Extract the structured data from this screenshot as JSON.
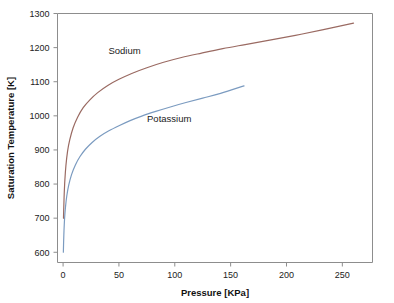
{
  "chart_data": {
    "type": "line",
    "title": "",
    "xlabel": "Pressure [KPa]",
    "ylabel": "Saturation Temperature [K]",
    "xlim": [
      -5,
      277
    ],
    "ylim": [
      570,
      1300
    ],
    "grid": false,
    "legend_position": "inline-annotations",
    "xticks": [
      0,
      50,
      100,
      150,
      200,
      250
    ],
    "xtick_labels": [
      "0",
      "50",
      "100",
      "150",
      "200",
      "250"
    ],
    "yticks": [
      600,
      700,
      800,
      900,
      1000,
      1100,
      1200,
      1300
    ],
    "ytick_labels": [
      "600",
      "700",
      "800",
      "900",
      "1000",
      "1100",
      "1200",
      "1300"
    ],
    "series": [
      {
        "name": "Sodium",
        "color": "#9a6a62",
        "label_x": 55,
        "label_y": 1182,
        "x": [
          0.35,
          0.6,
          1,
          1.6,
          2.5,
          4,
          6,
          9,
          13,
          18,
          24,
          31,
          40,
          50,
          62,
          75,
          90,
          106,
          124,
          143,
          163,
          185,
          208,
          232,
          260
        ],
        "y": [
          700,
          730,
          770,
          812,
          853,
          896,
          930,
          965,
          996,
          1024,
          1047,
          1068,
          1089,
          1107,
          1125,
          1141,
          1157,
          1171,
          1184,
          1197,
          1209,
          1222,
          1236,
          1252,
          1272
        ]
      },
      {
        "name": "Potassium",
        "color": "#7b9bc0",
        "label_x": 95,
        "label_y": 982,
        "x": [
          0.25,
          0.45,
          0.8,
          1.3,
          2.1,
          3.3,
          5,
          7.5,
          11,
          15,
          20,
          26,
          33,
          41,
          50,
          60,
          71,
          83,
          96,
          110,
          125,
          141,
          162
        ],
        "y": [
          600,
          627,
          662,
          697,
          731,
          765,
          796,
          827,
          856,
          880,
          902,
          922,
          940,
          956,
          971,
          986,
          1000,
          1013,
          1026,
          1039,
          1052,
          1066,
          1088
        ]
      }
    ]
  },
  "axes": {
    "x_title": "Pressure [KPa]",
    "y_title": "Saturation Temperature [K]"
  },
  "annotations": {
    "sodium_label": "Sodium",
    "potassium_label": "Potassium"
  }
}
